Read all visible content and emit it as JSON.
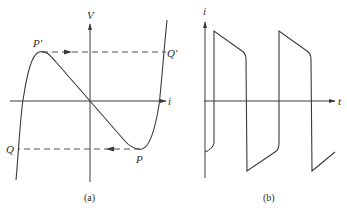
{
  "figure_a": {
    "caption": "(a)",
    "axes": {
      "vertical_label": "V",
      "horizontal_label": "i"
    },
    "points": {
      "p_prime": "P′",
      "q_prime": "Q′",
      "p": "P",
      "q": "Q"
    },
    "description": "N-shaped V–i characteristic (negative resistance region between P′ and P), with dashed jump transitions P′→Q′ and P→Q"
  },
  "figure_b": {
    "caption": "(b)",
    "axes": {
      "vertical_label": "i",
      "horizontal_label": "t"
    },
    "description": "Relaxation-oscillation current waveform: alternating sharp jumps with sloped plateaus"
  }
}
